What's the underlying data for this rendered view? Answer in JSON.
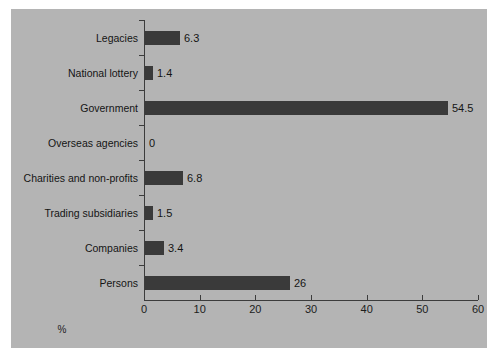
{
  "chart_data": {
    "type": "bar",
    "orientation": "horizontal",
    "title": "",
    "xlabel": "%",
    "ylabel": "",
    "xlim": [
      0,
      60
    ],
    "xticks": [
      "0",
      "10",
      "20",
      "30",
      "40",
      "50",
      "60"
    ],
    "grid": false,
    "legend": null,
    "categories": [
      "Legacies",
      "National lottery",
      "Government",
      "Overseas agencies",
      "Charities and non-profits",
      "Trading subsidiaries",
      "Companies",
      "Persons"
    ],
    "values": [
      6.3,
      1.4,
      54.5,
      0,
      6.8,
      1.5,
      3.4,
      26
    ],
    "value_labels": [
      "6.3",
      "1.4",
      "54.5",
      "0",
      "6.8",
      "1.5",
      "3.4",
      "26"
    ],
    "colors": {
      "bar": "#3a3a3a",
      "panel_background": "#b4b4b4",
      "figure_background": "#ffffff",
      "axis": "#3c3c3c",
      "text": "#141414"
    }
  }
}
